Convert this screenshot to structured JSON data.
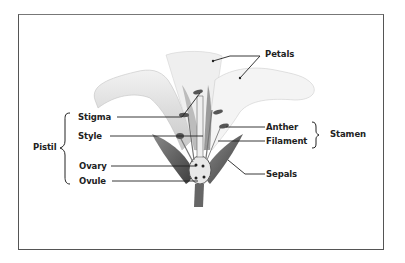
{
  "diagram": {
    "labels": {
      "petals": "Petals",
      "stigma": "Stigma",
      "style": "Style",
      "ovary": "Ovary",
      "ovule": "Ovule",
      "anther": "Anther",
      "filament": "Filament",
      "sepals": "Sepals"
    },
    "groups": {
      "pistil": "Pistil",
      "stamen": "Stamen"
    }
  }
}
